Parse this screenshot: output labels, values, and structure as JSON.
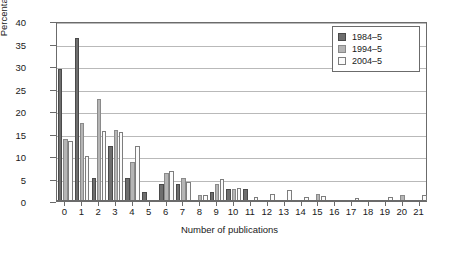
{
  "chart_data": {
    "type": "bar",
    "title": "",
    "xlabel": "Number of publications",
    "ylabel": "Percentage",
    "ylim": [
      0,
      40
    ],
    "ytick_step": 5,
    "grid": true,
    "legend_position": "top-right",
    "categories": [
      "0",
      "1",
      "2",
      "3",
      "4",
      "5",
      "6",
      "7",
      "8",
      "9",
      "10",
      "11",
      "12",
      "13",
      "14",
      "15",
      "16",
      "17",
      "18",
      "19",
      "20",
      "21"
    ],
    "series": [
      {
        "name": "1984–5",
        "color": "#6e6e6e",
        "values": [
          29.3,
          36.3,
          5.2,
          12.3,
          5.2,
          1.9,
          3.7,
          3.7,
          0,
          2.0,
          2.7,
          2.6,
          0,
          0,
          0,
          0,
          0,
          0,
          0,
          0,
          0,
          0
        ]
      },
      {
        "name": "1994–5",
        "color": "#b5b5b5",
        "values": [
          13.8,
          17.4,
          22.6,
          15.7,
          8.6,
          0,
          6.2,
          5.1,
          1.3,
          3.8,
          2.6,
          0,
          0,
          0,
          0,
          1.6,
          0,
          0,
          0,
          0,
          1.3,
          0
        ]
      },
      {
        "name": "2004–5",
        "color": "#fbfbfb",
        "values": [
          13.3,
          10.0,
          15.5,
          15.3,
          12.2,
          0,
          6.6,
          4.2,
          1.4,
          4.8,
          3.0,
          1.0,
          1.5,
          2.4,
          0.8,
          1.1,
          0,
          0.7,
          0,
          0.8,
          0,
          1.4
        ]
      }
    ]
  },
  "legend": {
    "entries": [
      {
        "label": "1984–5"
      },
      {
        "label": "1994–5"
      },
      {
        "label": "2004–5"
      }
    ]
  }
}
